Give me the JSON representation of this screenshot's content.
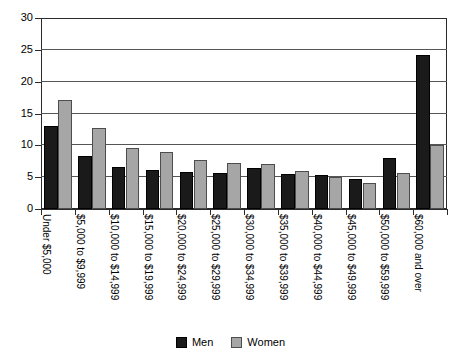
{
  "chart_data": {
    "type": "bar",
    "title": "",
    "subtitle": "",
    "xlabel": "",
    "ylabel": "",
    "ylim": [
      0,
      30
    ],
    "yticks": [
      0,
      5,
      10,
      15,
      20,
      25,
      30
    ],
    "grid": true,
    "legend_position": "bottom-center",
    "categories": [
      "Under $5,000",
      "$5,000 to $9,999",
      "$10,000 to $14,999",
      "$15,000 to $19,999",
      "$20,000 to $24,999",
      "$25,000 to $29,999",
      "$30,000 to $34,999",
      "$35,000 to $39,999",
      "$40,000 to $44,999",
      "$45,000 to $49,999",
      "$50,000 to $59,999",
      "$60,000 and over"
    ],
    "series": [
      {
        "name": "Men",
        "color": "#1a1a1a",
        "values": [
          13.1,
          8.3,
          6.6,
          6.1,
          5.8,
          5.7,
          6.4,
          5.5,
          5.3,
          4.7,
          8.0,
          24.2
        ]
      },
      {
        "name": "Women",
        "color": "#a6a6a6",
        "values": [
          17.2,
          12.7,
          9.6,
          8.9,
          7.7,
          7.2,
          7.0,
          5.9,
          5.1,
          4.1,
          5.7,
          10.0
        ]
      }
    ]
  },
  "legend": {
    "items": [
      {
        "label": "Men",
        "swatch": "men"
      },
      {
        "label": "Women",
        "swatch": "women"
      }
    ]
  }
}
